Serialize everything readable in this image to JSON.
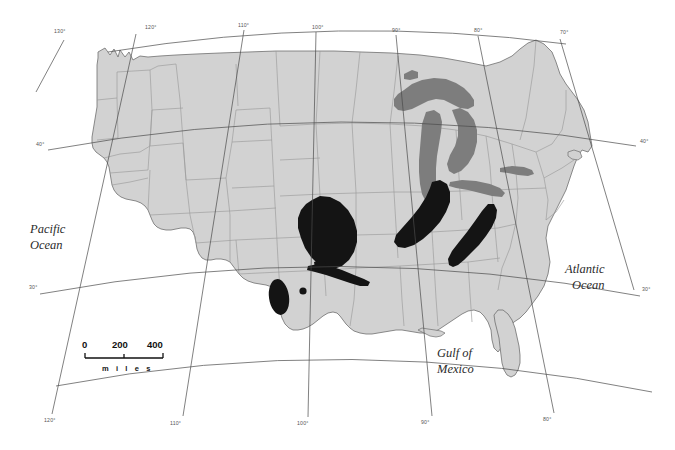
{
  "map": {
    "title": "Distribution map of the contiguous United States",
    "projection": "conic",
    "background_color": "#ffffff",
    "land_color": "#d2d2d2",
    "land_border_color": "#9a9a9a",
    "coast_color": "#6e6e6e",
    "lakes_color": "#7d7d7d",
    "range_color": "#141414",
    "graticule_color": "#4a4a4a"
  },
  "ocean_labels": [
    {
      "id": "pacific",
      "line1": "Pacific",
      "line2": "Ocean",
      "x": 47,
      "y": 232
    },
    {
      "id": "atlantic",
      "line1": "Atlantic",
      "line2": "Ocean",
      "x": 582,
      "y": 272
    },
    {
      "id": "gulf",
      "line1": "Gulf of",
      "line2": "Mexico",
      "x": 455,
      "y": 358
    }
  ],
  "graticule": {
    "longitude_labels_top": [
      {
        "value": "130°",
        "x": 60,
        "y": 36
      },
      {
        "value": "120°",
        "x": 151,
        "y": 32
      },
      {
        "value": "110°",
        "x": 244,
        "y": 30
      },
      {
        "value": "100°",
        "x": 318,
        "y": 32
      },
      {
        "value": "90°",
        "x": 398,
        "y": 35
      },
      {
        "value": "80°",
        "x": 480,
        "y": 35
      },
      {
        "value": "70°",
        "x": 566,
        "y": 37
      }
    ],
    "longitude_labels_bottom": [
      {
        "value": "120°",
        "x": 50,
        "y": 420
      },
      {
        "value": "110°",
        "x": 176,
        "y": 423
      },
      {
        "value": "100°",
        "x": 303,
        "y": 423
      },
      {
        "value": "90°",
        "x": 427,
        "y": 422
      },
      {
        "value": "80°",
        "x": 549,
        "y": 419
      }
    ],
    "latitude_labels_left": [
      {
        "value": "40°",
        "x": 40,
        "y": 147
      },
      {
        "value": "30°",
        "x": 33,
        "y": 290
      }
    ],
    "latitude_labels_right": [
      {
        "value": "40°",
        "x": 641,
        "y": 144
      },
      {
        "value": "30°",
        "x": 643,
        "y": 292
      }
    ]
  },
  "scale_bar": {
    "ticks": [
      "0",
      "200",
      "400"
    ],
    "unit_label": "m i l e s",
    "x": 82,
    "y": 352,
    "width": 78
  },
  "chart_data": {
    "type": "map",
    "legend": [
      {
        "label": "land",
        "color": "#d2d2d2"
      },
      {
        "label": "great lakes",
        "color": "#7d7d7d"
      },
      {
        "label": "distribution range",
        "color": "#141414"
      }
    ],
    "range_patches": [
      {
        "id": "central-plains",
        "region": "Kansas / Nebraska / Oklahoma",
        "approx_center": [
          330,
          233
        ]
      },
      {
        "id": "southern-plains-streak",
        "region": "Oklahoma / north Texas",
        "approx_center": [
          341,
          273
        ]
      },
      {
        "id": "southwest-oval",
        "region": "west Texas / New Mexico",
        "approx_center": [
          279,
          297
        ]
      },
      {
        "id": "southwest-dot",
        "region": "west Texas",
        "approx_center": [
          303,
          292
        ]
      },
      {
        "id": "great-lakes-south",
        "region": "Indiana / Ohio / Michigan",
        "approx_center": [
          440,
          205
        ]
      },
      {
        "id": "appalachian",
        "region": "Kentucky / Tennessee",
        "approx_center": [
          477,
          232
        ]
      }
    ],
    "axis_ranges": {
      "longitude": [
        -130,
        -70
      ],
      "latitude": [
        25,
        49
      ]
    }
  }
}
